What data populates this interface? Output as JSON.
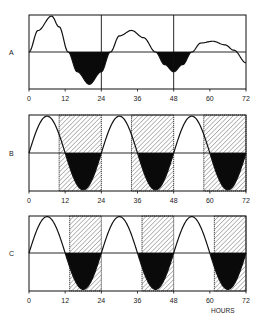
{
  "chart_data": [
    {
      "type": "line",
      "panel": "A",
      "title": "",
      "xlabel": "",
      "ylabel": "",
      "x_ticks": [
        0,
        12,
        24,
        36,
        48,
        60,
        72
      ],
      "xlim": [
        0,
        72
      ],
      "ylim": [
        -1,
        1
      ],
      "vertical_gridlines": [
        24,
        48
      ],
      "zero_line": true,
      "hatched_regions": [],
      "filled_below_zero": true,
      "description": "Damped oscillation, period ~27h; troughs shaded black",
      "series": [
        {
          "name": "A",
          "x": [
            0,
            3,
            7.5,
            10,
            13,
            16,
            20,
            24,
            27,
            30,
            34,
            38,
            42,
            45,
            48,
            51,
            54,
            57,
            61,
            65,
            68,
            72
          ],
          "y": [
            0.0,
            0.6,
            1.0,
            0.7,
            0.0,
            -0.55,
            -0.9,
            -0.55,
            0.0,
            0.45,
            0.6,
            0.4,
            0.0,
            -0.35,
            -0.55,
            -0.35,
            0.0,
            0.25,
            0.3,
            0.2,
            0.05,
            -0.3
          ]
        }
      ]
    },
    {
      "type": "line",
      "panel": "B",
      "xlabel": "",
      "x_ticks": [
        0,
        12,
        24,
        36,
        48,
        60,
        72
      ],
      "xlim": [
        0,
        72
      ],
      "ylim": [
        -1,
        1
      ],
      "zero_line": true,
      "hatched_regions": [
        [
          10,
          24
        ],
        [
          34,
          48
        ],
        [
          58,
          72
        ]
      ],
      "filled_below_zero": true,
      "description": "Sustained 24h sine rhythm; hatched intervals start before the downward zero crossing",
      "series": [
        {
          "name": "B",
          "period_hours": 24,
          "peak_hour": 6,
          "amplitude": 1.0,
          "offset": 0.15
        }
      ]
    },
    {
      "type": "line",
      "panel": "C",
      "xlabel": "HOURS",
      "x_ticks": [
        0,
        12,
        24,
        36,
        48,
        60,
        72
      ],
      "xlim": [
        0,
        72
      ],
      "ylim": [
        -1,
        1
      ],
      "zero_line": true,
      "hatched_regions": [
        [
          13.5,
          24
        ],
        [
          37.5,
          48
        ],
        [
          61.5,
          72
        ]
      ],
      "filled_below_zero": true,
      "description": "Sustained 24h sine rhythm; hatched intervals start after the downward zero crossing",
      "series": [
        {
          "name": "C",
          "period_hours": 24,
          "peak_hour": 6,
          "amplitude": 1.0,
          "offset": 0.0
        }
      ]
    }
  ],
  "panels": {
    "a": {
      "label": "A"
    },
    "b": {
      "label": "B"
    },
    "c": {
      "label": "C"
    }
  },
  "axis": {
    "ticks": [
      "0",
      "12",
      "24",
      "36",
      "48",
      "60",
      "72"
    ],
    "xlabel": "HOURS"
  },
  "colors": {
    "ink": "#111111",
    "background": "#ffffff",
    "hatch": "#555555"
  }
}
